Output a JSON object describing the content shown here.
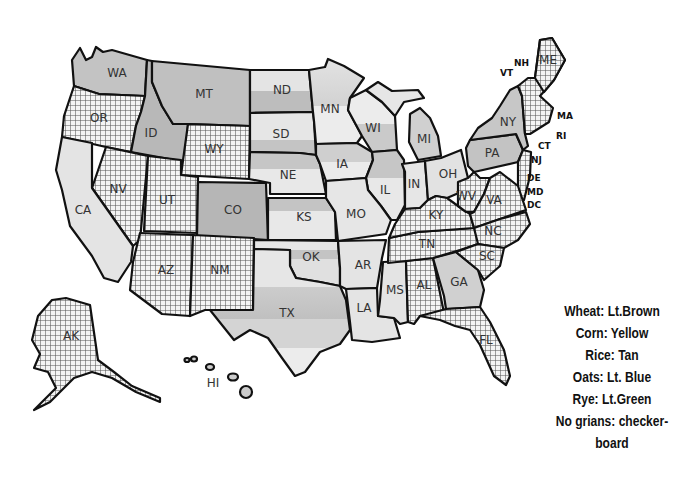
{
  "map": {
    "title": "US grain production map",
    "fills": {
      "wheat": "#b4b4b4",
      "corn": "#dcdcdc",
      "rice": "#c8c8c8",
      "oats": "#e6e6e6",
      "rye": "#d2d2d2",
      "none": "checkerboard",
      "land_light": "#e2e2e2",
      "land_mid": "#c2c2c2",
      "border": "#111111"
    },
    "states": [
      {
        "code": "WA",
        "x": 117,
        "y": 73
      },
      {
        "code": "OR",
        "x": 99,
        "y": 118
      },
      {
        "code": "ID",
        "x": 151,
        "y": 133
      },
      {
        "code": "MT",
        "x": 204,
        "y": 94
      },
      {
        "code": "WY",
        "x": 214,
        "y": 149
      },
      {
        "code": "ND",
        "x": 282,
        "y": 90
      },
      {
        "code": "SD",
        "x": 281,
        "y": 134
      },
      {
        "code": "NE",
        "x": 288,
        "y": 175
      },
      {
        "code": "MN",
        "x": 330,
        "y": 109
      },
      {
        "code": "WI",
        "x": 373,
        "y": 128
      },
      {
        "code": "MI",
        "x": 424,
        "y": 139
      },
      {
        "code": "IA",
        "x": 342,
        "y": 164
      },
      {
        "code": "IL",
        "x": 385,
        "y": 190
      },
      {
        "code": "IN",
        "x": 414,
        "y": 184
      },
      {
        "code": "OH",
        "x": 448,
        "y": 174
      },
      {
        "code": "NY",
        "x": 508,
        "y": 122
      },
      {
        "code": "PA",
        "x": 492,
        "y": 153
      },
      {
        "code": "NV",
        "x": 118,
        "y": 189
      },
      {
        "code": "UT",
        "x": 167,
        "y": 200
      },
      {
        "code": "CO",
        "x": 233,
        "y": 210
      },
      {
        "code": "KS",
        "x": 304,
        "y": 217
      },
      {
        "code": "MO",
        "x": 356,
        "y": 214
      },
      {
        "code": "CA",
        "x": 83,
        "y": 210
      },
      {
        "code": "AZ",
        "x": 166,
        "y": 270
      },
      {
        "code": "NM",
        "x": 220,
        "y": 270
      },
      {
        "code": "OK",
        "x": 311,
        "y": 257
      },
      {
        "code": "AR",
        "x": 363,
        "y": 265
      },
      {
        "code": "TX",
        "x": 287,
        "y": 313
      },
      {
        "code": "LA",
        "x": 364,
        "y": 308
      },
      {
        "code": "MS",
        "x": 395,
        "y": 290
      },
      {
        "code": "AL",
        "x": 424,
        "y": 285
      },
      {
        "code": "GA",
        "x": 459,
        "y": 282
      },
      {
        "code": "FL",
        "x": 486,
        "y": 340
      },
      {
        "code": "KY",
        "x": 436,
        "y": 215
      },
      {
        "code": "TN",
        "x": 427,
        "y": 244
      },
      {
        "code": "WV",
        "x": 466,
        "y": 196
      },
      {
        "code": "VA",
        "x": 494,
        "y": 200
      },
      {
        "code": "NC",
        "x": 493,
        "y": 231
      },
      {
        "code": "SC",
        "x": 487,
        "y": 256
      },
      {
        "code": "ME",
        "x": 548,
        "y": 60
      },
      {
        "code": "AK",
        "x": 71,
        "y": 336
      },
      {
        "code": "HI",
        "x": 213,
        "y": 383
      }
    ],
    "outside_labels": [
      {
        "code": "NH",
        "x": 514,
        "y": 63
      },
      {
        "code": "VT",
        "x": 500,
        "y": 73
      },
      {
        "code": "MA",
        "x": 557,
        "y": 116
      },
      {
        "code": "RI",
        "x": 556,
        "y": 136
      },
      {
        "code": "CT",
        "x": 538,
        "y": 146
      },
      {
        "code": "NJ",
        "x": 531,
        "y": 160
      },
      {
        "code": "DE",
        "x": 527,
        "y": 178
      },
      {
        "code": "MD",
        "x": 527,
        "y": 192
      },
      {
        "code": "DC",
        "x": 527,
        "y": 205
      }
    ]
  },
  "legend": {
    "items": [
      "Wheat: Lt.Brown",
      "Corn: Yellow",
      "Rice: Tan",
      "Oats: Lt. Blue",
      "Rye: Lt.Green",
      "No grians: checker-",
      "board"
    ]
  }
}
